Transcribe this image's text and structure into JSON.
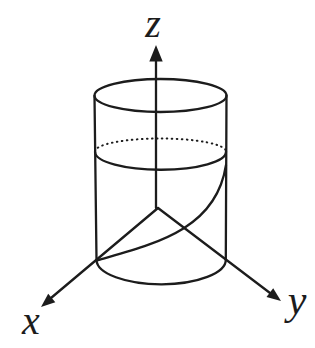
{
  "figure": {
    "type": "3d-wireframe-diagram",
    "background_color": "#ffffff",
    "ink_color": "#1c1c1c",
    "axes": {
      "x": {
        "label": "x"
      },
      "y": {
        "label": "y"
      },
      "z": {
        "label": "z"
      }
    },
    "shapes": {
      "cylinder": "wireframe cylinder",
      "mid_circle_back": "hidden back half of horizontal cross-section (dotted)",
      "mid_circle_front": "visible front half of horizontal cross-section",
      "sweep_curve": "curve rising from bottom-left rim to right silhouette"
    }
  }
}
